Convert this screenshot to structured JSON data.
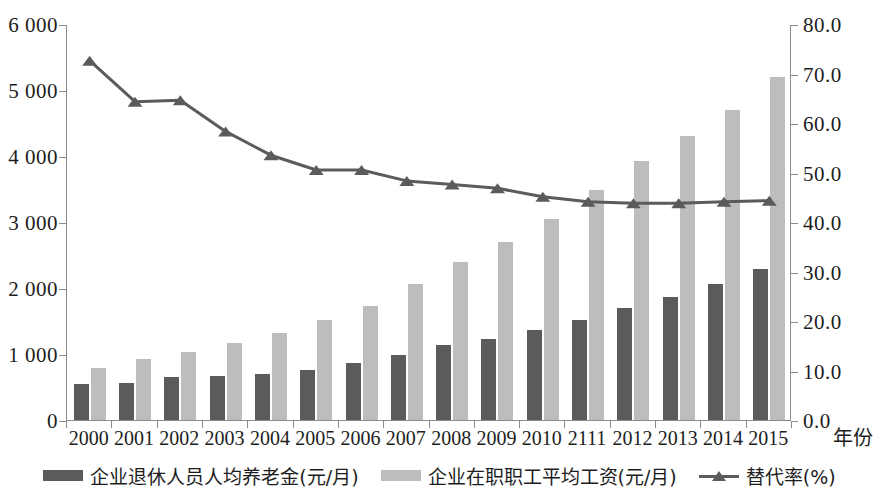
{
  "chart_data": {
    "type": "bar",
    "title": "",
    "subtitle": "",
    "xlabel": "年份",
    "ylabel_left": "",
    "ylabel_right": "",
    "categories": [
      "2000",
      "2001",
      "2002",
      "2003",
      "2004",
      "2005",
      "2006",
      "2007",
      "2008",
      "2009",
      "2010",
      "2111",
      "2012",
      "2013",
      "2014",
      "2015"
    ],
    "x_tick_labels": [
      "2000",
      "2001",
      "2002",
      "2003",
      "2004",
      "2005",
      "2006",
      "2007",
      "2008",
      "2009",
      "2010",
      "2111",
      "2012",
      "2013",
      "2014",
      "2015"
    ],
    "y_left_ticks": [
      "0",
      "1 000",
      "2 000",
      "3 000",
      "4 000",
      "5 000",
      "6 000"
    ],
    "y_left_values": [
      0,
      1000,
      2000,
      3000,
      4000,
      5000,
      6000
    ],
    "y_right_ticks": [
      "0.0",
      "10.0",
      "20.0",
      "30.0",
      "40.0",
      "50.0",
      "60.0",
      "70.0",
      "80.0"
    ],
    "y_right_values": [
      0,
      10,
      20,
      30,
      40,
      50,
      60,
      70,
      80
    ],
    "ylim_left": [
      0,
      6000
    ],
    "ylim_right": [
      0,
      80
    ],
    "grid": false,
    "legend_position": "bottom",
    "series": [
      {
        "name": "企业退休人员人均养老金(元/月)",
        "type": "bar",
        "axis": "left",
        "color": "#5b5b5b",
        "values": [
          550,
          560,
          650,
          670,
          700,
          760,
          870,
          980,
          1130,
          1230,
          1360,
          1520,
          1690,
          1860,
          2060,
          2290
        ]
      },
      {
        "name": "企业在职职工平均工资(元/月)",
        "type": "bar",
        "axis": "left",
        "color": "#bdbdbd",
        "values": [
          790,
          920,
          1030,
          1160,
          1320,
          1510,
          1730,
          2060,
          2400,
          2690,
          3050,
          3490,
          3920,
          4310,
          4700,
          5200
        ]
      },
      {
        "name": "替代率(%)",
        "type": "line",
        "axis": "right",
        "color": "#5b5b5b",
        "marker": "triangle",
        "values": [
          72.8,
          64.5,
          64.8,
          58.5,
          53.7,
          50.7,
          50.7,
          48.5,
          47.8,
          47.0,
          45.3,
          44.3,
          44.0,
          44.0,
          44.3,
          44.5
        ]
      }
    ]
  },
  "legend": {
    "items": [
      {
        "label": "企业退休人员人均养老金(元/月)",
        "swatch": "dark-bar-swatch"
      },
      {
        "label": "企业在职职工平均工资(元/月)",
        "swatch": "light-bar-swatch"
      },
      {
        "label": "替代率(%)",
        "swatch": "line-triangle-swatch"
      }
    ]
  },
  "colors": {
    "dark_bar": "#5b5b5b",
    "light_bar": "#bdbdbd",
    "line": "#5b5b5b",
    "axis": "#8c8c8c",
    "text": "#1d1d1d",
    "background": "#ffffff"
  }
}
